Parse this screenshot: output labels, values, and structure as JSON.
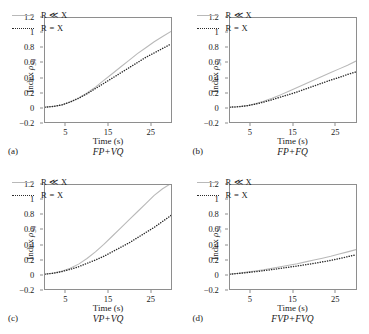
{
  "figure": {
    "axis_label_x": "Time (s)",
    "axis_label_y_prefix": "Index ",
    "axis_label_y_symbol": "ρ",
    "axis_label_y_subscript": "34",
    "legend": {
      "series_a_label": "R ≪ X",
      "series_b_label": "R = X"
    },
    "colors": {
      "series_a": "#b9b9b9",
      "series_b": "#2b2b2b",
      "frame": "#8e8e8e",
      "background": "#ffffff"
    }
  },
  "chart_data": [
    {
      "type": "line",
      "panel_tag": "(a)",
      "title": "FP+VQ",
      "xlabel": "Time (s)",
      "ylabel": "Index ρ₃₄",
      "xlim": [
        0,
        30
      ],
      "ylim": [
        -0.2,
        1.2
      ],
      "xticks": [
        5,
        15,
        25
      ],
      "yticks": [
        -0.2,
        0,
        0.2,
        0.4,
        0.6,
        0.8,
        1,
        1.2
      ],
      "grid": false,
      "legend_position": "top-left",
      "x": [
        0,
        2,
        4,
        6,
        8,
        10,
        12,
        14,
        16,
        18,
        20,
        22,
        24,
        26,
        28,
        30
      ],
      "series": [
        {
          "name": "R ≪ X",
          "style": "solid",
          "color": "#b9b9b9",
          "values": [
            0.0,
            0.01,
            0.03,
            0.07,
            0.12,
            0.19,
            0.27,
            0.36,
            0.45,
            0.54,
            0.63,
            0.72,
            0.8,
            0.88,
            0.95,
            1.02
          ]
        },
        {
          "name": "R = X",
          "style": "dotted",
          "color": "#2b2b2b",
          "values": [
            0.0,
            0.01,
            0.03,
            0.07,
            0.12,
            0.18,
            0.25,
            0.32,
            0.39,
            0.46,
            0.53,
            0.6,
            0.67,
            0.73,
            0.79,
            0.85
          ]
        }
      ]
    },
    {
      "type": "line",
      "panel_tag": "(b)",
      "title": "FP+FQ",
      "xlabel": "Time (s)",
      "ylabel": "Index ρ₃₄",
      "xlim": [
        0,
        30
      ],
      "ylim": [
        -0.2,
        1.2
      ],
      "xticks": [
        5,
        15,
        25
      ],
      "yticks": [
        -0.2,
        0,
        0.2,
        0.4,
        0.6,
        0.8,
        1,
        1.2
      ],
      "grid": false,
      "legend_position": "top-left",
      "x": [
        0,
        2,
        4,
        6,
        8,
        10,
        12,
        14,
        16,
        18,
        20,
        22,
        24,
        26,
        28,
        30
      ],
      "series": [
        {
          "name": "R ≪ X",
          "style": "solid",
          "color": "#b9b9b9",
          "values": [
            0.0,
            0.005,
            0.02,
            0.045,
            0.08,
            0.12,
            0.165,
            0.215,
            0.265,
            0.315,
            0.365,
            0.415,
            0.465,
            0.515,
            0.565,
            0.62
          ]
        },
        {
          "name": "R = X",
          "style": "dotted",
          "color": "#2b2b2b",
          "values": [
            0.0,
            0.005,
            0.018,
            0.04,
            0.068,
            0.1,
            0.135,
            0.17,
            0.205,
            0.245,
            0.285,
            0.325,
            0.365,
            0.4,
            0.44,
            0.475
          ]
        }
      ]
    },
    {
      "type": "line",
      "panel_tag": "(c)",
      "title": "VP+VQ",
      "xlabel": "Time (s)",
      "ylabel": "Index ρ₃₄",
      "xlim": [
        0,
        30
      ],
      "ylim": [
        -0.2,
        1.2
      ],
      "xticks": [
        5,
        15,
        25
      ],
      "yticks": [
        -0.2,
        0,
        0.2,
        0.4,
        0.6,
        0.8,
        1,
        1.2
      ],
      "grid": false,
      "legend_position": "top-left",
      "x": [
        0,
        2,
        4,
        6,
        8,
        10,
        12,
        14,
        16,
        18,
        20,
        22,
        24,
        26,
        28,
        30
      ],
      "series": [
        {
          "name": "R ≪ X",
          "style": "solid",
          "color": "#b9b9b9",
          "values": [
            0.0,
            0.015,
            0.04,
            0.08,
            0.135,
            0.21,
            0.3,
            0.4,
            0.51,
            0.62,
            0.73,
            0.84,
            0.95,
            1.06,
            1.15,
            1.22
          ]
        },
        {
          "name": "R = X",
          "style": "dotted",
          "color": "#2b2b2b",
          "values": [
            0.0,
            0.012,
            0.035,
            0.065,
            0.1,
            0.145,
            0.19,
            0.24,
            0.3,
            0.36,
            0.42,
            0.49,
            0.56,
            0.63,
            0.71,
            0.79
          ]
        }
      ]
    },
    {
      "type": "line",
      "panel_tag": "(d)",
      "title": "FVP+FVQ",
      "xlabel": "Time (s)",
      "ylabel": "Index ρ₃₄",
      "xlim": [
        0,
        30
      ],
      "ylim": [
        -0.2,
        1.2
      ],
      "xticks": [
        5,
        15,
        25
      ],
      "yticks": [
        -0.2,
        0,
        0.2,
        0.4,
        0.6,
        0.8,
        1,
        1.2
      ],
      "grid": false,
      "legend_position": "top-left",
      "x": [
        0,
        2,
        4,
        6,
        8,
        10,
        12,
        14,
        16,
        18,
        20,
        22,
        24,
        26,
        28,
        30
      ],
      "series": [
        {
          "name": "R ≪ X",
          "style": "solid",
          "color": "#b9b9b9",
          "values": [
            0.0,
            0.012,
            0.027,
            0.043,
            0.06,
            0.08,
            0.1,
            0.12,
            0.14,
            0.165,
            0.19,
            0.215,
            0.24,
            0.27,
            0.3,
            0.33
          ]
        },
        {
          "name": "R = X",
          "style": "dotted",
          "color": "#2b2b2b",
          "values": [
            0.0,
            0.009,
            0.02,
            0.033,
            0.047,
            0.062,
            0.078,
            0.094,
            0.11,
            0.127,
            0.145,
            0.165,
            0.185,
            0.21,
            0.235,
            0.26
          ]
        }
      ]
    }
  ]
}
